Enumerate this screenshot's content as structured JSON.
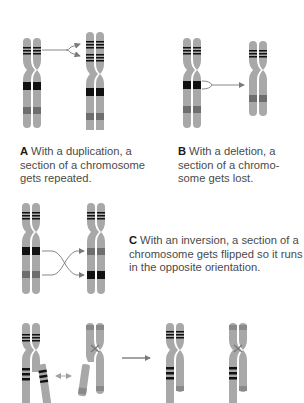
{
  "panels": {
    "A": {
      "letter": "A",
      "text": "With a duplication, a section of a chromosome gets repeated.",
      "line1": "With a duplication, a",
      "line2": "section of a chromosome",
      "line3": "gets repeated."
    },
    "B": {
      "letter": "B",
      "text": "With a deletion, a section of a chromosome gets lost.",
      "line1": "With a deletion, a",
      "line2": "section of a chromo-",
      "line3": "some gets lost."
    },
    "C": {
      "letter": "C",
      "text": "With an inversion, a section of a chromosome gets flipped so it runs in the opposite orientation.",
      "line1": "With an inversion, a section of a",
      "line2": "chromosome gets flipped so it runs",
      "line3": "in the opposite orientation."
    },
    "D": {
      "description": "Translocation: segments exchanged between two different chromosomes"
    }
  },
  "colors": {
    "chromosome_light": "#a8a8a8",
    "chromosome_dark": "#8a8a8a",
    "band_black": "#111111",
    "band_gray": "#6e6e6e",
    "arrow": "#7a7a7a",
    "caption_text": "#4a4a4a",
    "caption_letter": "#1a1a1a"
  }
}
